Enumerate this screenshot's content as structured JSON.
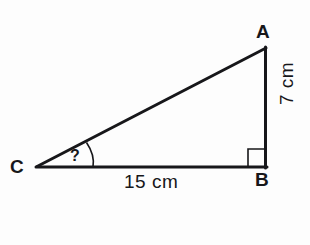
{
  "diagram": {
    "type": "right-triangle-geometry",
    "background_color": "#fdfdfd",
    "stroke_color": "#17171a",
    "vertices": [
      {
        "name": "A",
        "label": "A",
        "x": 266,
        "y": 48
      },
      {
        "name": "B",
        "label": "B",
        "x": 266,
        "y": 167
      },
      {
        "name": "C",
        "label": "C",
        "x": 37,
        "y": 167
      }
    ],
    "sides": [
      {
        "name": "base-CB",
        "label": "15 cm",
        "from": "C",
        "to": "B",
        "value": 15,
        "unit": "cm"
      },
      {
        "name": "height-AB",
        "label": "7 cm",
        "from": "A",
        "to": "B",
        "value": 7,
        "unit": "cm",
        "rotated": true
      },
      {
        "name": "hypotenuse-CA",
        "label": "",
        "from": "C",
        "to": "A"
      }
    ],
    "angles": [
      {
        "name": "angle-at-C",
        "label": "?",
        "vertex": "C",
        "marker": "arc"
      },
      {
        "name": "right-angle-at-B",
        "label": "",
        "vertex": "B",
        "marker": "square"
      }
    ]
  }
}
